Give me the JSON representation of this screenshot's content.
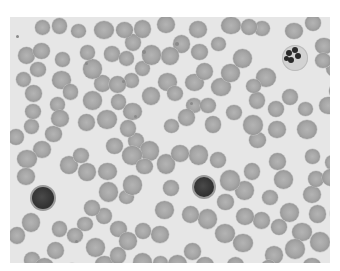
{
  "image": {
    "subject": "Peripheral blood smear micrograph (grayscale)",
    "frame": {
      "x": 10,
      "y": 17,
      "width": 320,
      "height": 246
    },
    "colors": {
      "page": "#ffffff",
      "background": "#e6e6e6",
      "rbc": "#a6a6a6",
      "rbc_rim": "#8e8e8e",
      "nucleus": "#333333"
    },
    "cells": {
      "lymphocytes": [
        {
          "x": 30,
          "y": 185,
          "d": 26
        },
        {
          "x": 192,
          "y": 175,
          "d": 24
        }
      ],
      "neutrophil": {
        "x": 282,
        "y": 45,
        "d": 26,
        "lobes": [
          [
            7,
            8,
            6
          ],
          [
            13,
            5,
            6
          ],
          [
            16,
            11,
            6
          ],
          [
            9,
            15,
            6
          ],
          [
            4,
            13,
            5
          ]
        ]
      },
      "platelets": [
        [
          142,
          50,
          4
        ],
        [
          175,
          42,
          4
        ],
        [
          85,
          62,
          3
        ],
        [
          122,
          80,
          3
        ],
        [
          190,
          102,
          3
        ],
        [
          134,
          115,
          3
        ],
        [
          16,
          35,
          3
        ],
        [
          75,
          240,
          3
        ]
      ]
    }
  }
}
